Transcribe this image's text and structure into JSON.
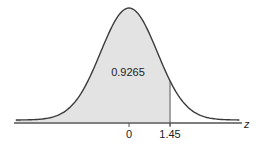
{
  "chart_data": {
    "type": "area",
    "xlabel": "z",
    "ylabel": "",
    "distribution": "standard normal",
    "shaded_region": {
      "from": "-inf",
      "to": 1.45,
      "area": 0.9265
    },
    "area_label": "0.9265",
    "tick_labels": [
      "0",
      "1.45"
    ],
    "ticks": [
      0,
      1.45
    ],
    "xlim": [
      -4.0,
      3.9
    ],
    "grid": false,
    "legend": null
  },
  "colors": {
    "curve": "#3a3a3a",
    "shade": "#e3e3e3",
    "axis": "#555555",
    "text": "#222222"
  }
}
